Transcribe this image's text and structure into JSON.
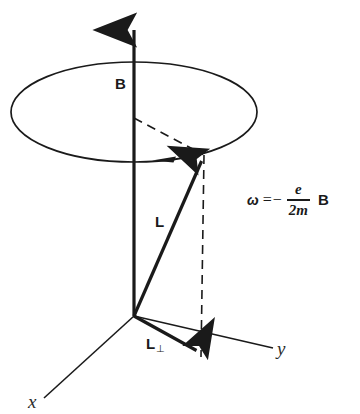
{
  "figure": {
    "kind": "physics-vector-diagram",
    "topic": "Larmor precession of angular momentum L about magnetic field B",
    "background_color": "#ffffff",
    "ink_color": "#1a1a1a"
  },
  "labels": {
    "magnetic_field": "B",
    "angular_momentum": "L",
    "angular_momentum_perp": "L",
    "angular_momentum_perp_subscript": "⊥",
    "axis_x": "x",
    "axis_y": "y"
  },
  "equation": {
    "omega": "ω",
    "equals": "=",
    "minus": "−",
    "numerator": "e",
    "denominator": "2m",
    "field": "B",
    "plain_text": "ω = − e/2m B"
  },
  "geometry": {
    "origin": {
      "x": 134,
      "y": 316
    },
    "b_axis": {
      "x1": 134,
      "y1": 316,
      "x2": 134,
      "y2": 22,
      "arrow": "up"
    },
    "precession_ellipse": {
      "cx": 134,
      "cy": 112,
      "rx": 123,
      "ry": 50
    },
    "precession_arrow_tip": {
      "x": 152,
      "y": 161
    },
    "l_vector": {
      "x1": 134,
      "y1": 316,
      "x2": 204,
      "y2": 155,
      "arrow": "tip"
    },
    "l_perp_vector": {
      "x1": 134,
      "y1": 316,
      "x2": 201,
      "y2": 356,
      "arrow": "tip"
    },
    "dashed_radius": {
      "x1": 134,
      "y1": 118,
      "x2": 204,
      "y2": 155
    },
    "dashed_drop": {
      "x1": 204,
      "y1": 155,
      "x2": 201,
      "y2": 357
    },
    "x_axis": {
      "x1": 134,
      "y1": 316,
      "x2": 44,
      "y2": 398
    },
    "y_axis": {
      "x1": 134,
      "y1": 316,
      "x2": 273,
      "y2": 348
    }
  }
}
